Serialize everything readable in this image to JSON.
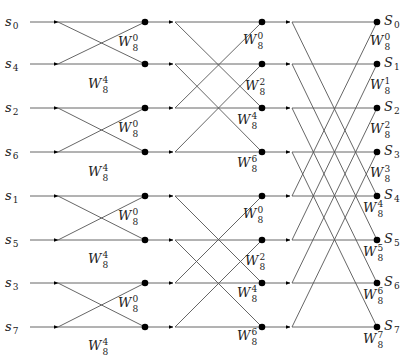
{
  "colors": {
    "line": "#555555",
    "dot": "#000000",
    "text": "#222222"
  },
  "geometry": {
    "rows_y": [
      22,
      64,
      108,
      152,
      196,
      240,
      283,
      327
    ],
    "x_input_label": 5,
    "x_line_start": 30,
    "x_stage1_start": 58,
    "x_stage1_end": 145,
    "x_stage2_start": 175,
    "x_stage2_end": 262,
    "x_stage3_start": 292,
    "x_stage3_end": 377,
    "x_output_label": 384
  },
  "inputs": [
    {
      "base": "s",
      "sub": "0"
    },
    {
      "base": "s",
      "sub": "4"
    },
    {
      "base": "s",
      "sub": "2"
    },
    {
      "base": "s",
      "sub": "6"
    },
    {
      "base": "s",
      "sub": "1"
    },
    {
      "base": "s",
      "sub": "5"
    },
    {
      "base": "s",
      "sub": "3"
    },
    {
      "base": "s",
      "sub": "7"
    }
  ],
  "outputs": [
    {
      "base": "S",
      "sub": "0"
    },
    {
      "base": "S",
      "sub": "1"
    },
    {
      "base": "S",
      "sub": "2"
    },
    {
      "base": "S",
      "sub": "3"
    },
    {
      "base": "S",
      "sub": "4"
    },
    {
      "base": "S",
      "sub": "5"
    },
    {
      "base": "S",
      "sub": "6"
    },
    {
      "base": "S",
      "sub": "7"
    }
  ],
  "stages": [
    {
      "name": "stage-1",
      "span": 1,
      "twiddles": [
        {
          "label": "W",
          "sub": "8",
          "sup": "0",
          "x": 118,
          "y": 46
        },
        {
          "label": "W",
          "sub": "8",
          "sup": "4",
          "x": 88,
          "y": 88
        },
        {
          "label": "W",
          "sub": "8",
          "sup": "0",
          "x": 118,
          "y": 132
        },
        {
          "label": "W",
          "sub": "8",
          "sup": "4",
          "x": 88,
          "y": 176
        },
        {
          "label": "W",
          "sub": "8",
          "sup": "0",
          "x": 118,
          "y": 220
        },
        {
          "label": "W",
          "sub": "8",
          "sup": "4",
          "x": 88,
          "y": 263
        },
        {
          "label": "W",
          "sub": "8",
          "sup": "0",
          "x": 118,
          "y": 307
        },
        {
          "label": "W",
          "sub": "8",
          "sup": "4",
          "x": 88,
          "y": 350
        }
      ]
    },
    {
      "name": "stage-2",
      "span": 2,
      "twiddles": [
        {
          "label": "W",
          "sub": "8",
          "sup": "0",
          "x": 243,
          "y": 44
        },
        {
          "label": "W",
          "sub": "8",
          "sup": "2",
          "x": 245,
          "y": 90
        },
        {
          "label": "W",
          "sub": "8",
          "sup": "4",
          "x": 237,
          "y": 124
        },
        {
          "label": "W",
          "sub": "8",
          "sup": "6",
          "x": 237,
          "y": 167
        },
        {
          "label": "W",
          "sub": "8",
          "sup": "0",
          "x": 243,
          "y": 218
        },
        {
          "label": "W",
          "sub": "8",
          "sup": "2",
          "x": 245,
          "y": 265
        },
        {
          "label": "W",
          "sub": "8",
          "sup": "4",
          "x": 237,
          "y": 297
        },
        {
          "label": "W",
          "sub": "8",
          "sup": "6",
          "x": 237,
          "y": 340
        }
      ]
    },
    {
      "name": "stage-3",
      "span": 4,
      "twiddles": [
        {
          "label": "W",
          "sub": "8",
          "sup": "0",
          "x": 370,
          "y": 45
        },
        {
          "label": "W",
          "sub": "8",
          "sup": "1",
          "x": 370,
          "y": 89
        },
        {
          "label": "W",
          "sub": "8",
          "sup": "2",
          "x": 370,
          "y": 133
        },
        {
          "label": "W",
          "sub": "8",
          "sup": "3",
          "x": 370,
          "y": 177
        },
        {
          "label": "W",
          "sub": "8",
          "sup": "4",
          "x": 363,
          "y": 212
        },
        {
          "label": "W",
          "sub": "8",
          "sup": "5",
          "x": 363,
          "y": 256
        },
        {
          "label": "W",
          "sub": "8",
          "sup": "6",
          "x": 363,
          "y": 299
        },
        {
          "label": "W",
          "sub": "8",
          "sup": "7",
          "x": 363,
          "y": 343
        }
      ]
    }
  ]
}
